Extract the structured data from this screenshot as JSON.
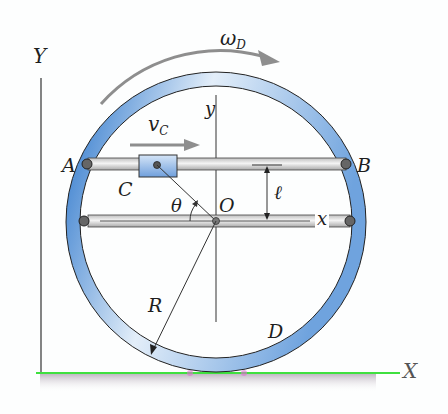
{
  "diagram": {
    "axes": {
      "global_y": "Y",
      "global_x": "X",
      "local_y": "y",
      "local_x": "x"
    },
    "angular_velocity": {
      "symbol": "ω",
      "subscript": "D"
    },
    "velocity": {
      "symbol": "v",
      "subscript": "C"
    },
    "points": {
      "A": "A",
      "B": "B",
      "C": "C",
      "O": "O"
    },
    "angle": "θ",
    "length": "ℓ",
    "radius": "R",
    "disk": "D"
  },
  "colors": {
    "ring_dark": "#3a7fd0",
    "ring_light": "#dbe9f7",
    "arrow_gray": "#8e8e8e",
    "ground_green": "#39e039",
    "slider_blue": "#8fb6e6",
    "pin": "#555555"
  }
}
